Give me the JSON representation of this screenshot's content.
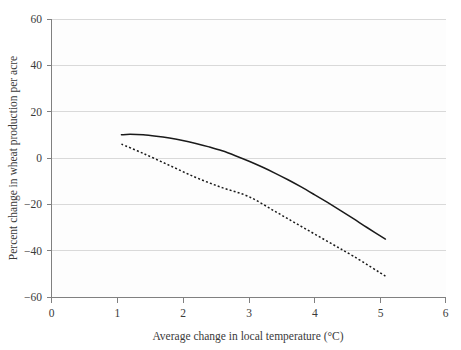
{
  "chart_data": {
    "type": "line",
    "title": "",
    "subtitle": "",
    "xlabel": "Average change in local temperature (°C)",
    "ylabel": "Percent change in wheat production per acre",
    "xlim": [
      0,
      6
    ],
    "ylim": [
      -60,
      60
    ],
    "xticks": [
      0,
      1,
      2,
      3,
      4,
      5,
      6
    ],
    "yticks": [
      60,
      40,
      20,
      0,
      -20,
      -40,
      -60
    ],
    "xtick_labels": [
      "0",
      "1",
      "2",
      "3",
      "4",
      "5",
      "6"
    ],
    "ytick_labels": [
      "60",
      "40",
      "20",
      "0",
      "−20",
      "−40",
      "−60"
    ],
    "grid": "horizontal",
    "legend": "none",
    "series": [
      {
        "name": "solid-curve",
        "style": "solid",
        "color": "#1a1a1a",
        "x": [
          1.07,
          1.2,
          1.4,
          1.6,
          1.8,
          2.0,
          2.2,
          2.4,
          2.6,
          2.8,
          3.0,
          3.2,
          3.4,
          3.6,
          3.8,
          4.0,
          4.2,
          4.4,
          4.6,
          4.8,
          5.08
        ],
        "y": [
          10.0,
          10.2,
          10.0,
          9.4,
          8.6,
          7.6,
          6.3,
          4.8,
          3.1,
          1.0,
          -1.3,
          -3.8,
          -6.5,
          -9.4,
          -12.5,
          -15.8,
          -19.2,
          -22.7,
          -26.3,
          -30.0,
          -35.0
        ]
      },
      {
        "name": "dashed-curve",
        "style": "dotted",
        "color": "#1a1a1a",
        "x": [
          1.07,
          1.4,
          1.8,
          2.2,
          2.6,
          3.0,
          3.4,
          3.8,
          4.2,
          4.6,
          5.08
        ],
        "y": [
          6.0,
          2.0,
          -3.2,
          -8.4,
          -12.8,
          -16.6,
          -23.0,
          -29.5,
          -36.0,
          -42.5,
          -51.0
        ]
      }
    ],
    "notes": {
      "solid_start": "(1.07, 10)",
      "solid_end": "(5.08, -35)",
      "dashed_start": "(1.07, 6)",
      "dashed_end": "(5.08, -51)"
    }
  },
  "colors": {
    "background": "#ffffff",
    "plot_background": "#fdfdfd",
    "gridline": "#d9d9d9",
    "axis": "#808080",
    "series": "#1a1a1a",
    "text": "#3a3a3a"
  }
}
